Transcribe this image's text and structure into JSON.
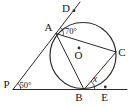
{
  "figure": {
    "background_color": "#ffffff",
    "line_color": "#2b2b2b",
    "text_color": "#141414",
    "point_labels": {
      "P": "P",
      "A": "A",
      "B": "B",
      "C": "C",
      "D": "D",
      "E": "E",
      "O": "O"
    },
    "angle_labels": {
      "at_A": "70°",
      "at_P": "50°",
      "at_B": "x"
    }
  }
}
